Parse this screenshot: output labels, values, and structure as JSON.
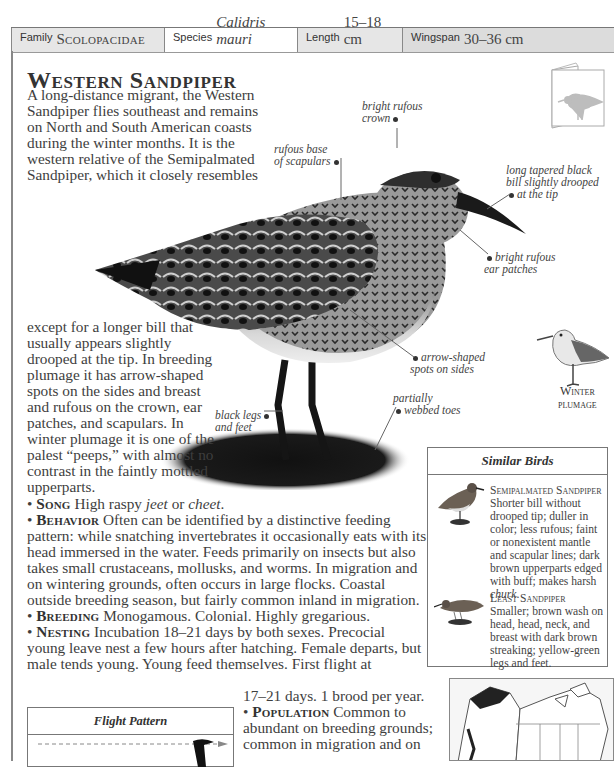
{
  "header": {
    "family_label": "Family",
    "family_value": "Scolopacidae",
    "species_label": "Species",
    "species_value": "Calidris mauri",
    "length_label": "Length",
    "length_value": "15–18 cm",
    "wingspan_label": "Wingspan",
    "wingspan_value": "30–36 cm"
  },
  "title": "Western Sandpiper",
  "intro": {
    "part1": "A long-distance migrant, the Western Sandpiper flies southeast and remains on North and South American coasts during the winter months. It is the western relative of the Semipalmated Sandpiper, which it closely resembles",
    "part2": "except for a longer bill that usually appears slightly drooped at the tip. In breeding plumage it has arrow-shaped spots on the sides and breast and rufous on the crown, ear patches, and scapulars. In winter plumage it is one of the palest “peeps,” with almost no contrast in the faintly mottled upperparts."
  },
  "annotations": {
    "crown": [
      "bright rufous",
      "crown"
    ],
    "scapulars": [
      "rufous base",
      "of scapulars"
    ],
    "bill": [
      "long tapered black",
      "bill slightly drooped",
      "at the tip"
    ],
    "ear": [
      "bright rufous",
      "ear patches"
    ],
    "spots": [
      "arrow-shaped",
      "spots on sides"
    ],
    "toes": [
      "partially",
      "webbed toes"
    ],
    "legs": [
      "black legs",
      "and feet"
    ]
  },
  "winter_label": [
    "Winter",
    "plumage"
  ],
  "facts": {
    "song": {
      "key": "Song",
      "text_a": " High raspy ",
      "em1": "jeet",
      "text_b": " or ",
      "em2": "cheet",
      "text_c": "."
    },
    "behavior": {
      "key": "Behavior",
      "text": " Often can be identified by a distinctive feeding pattern: while snatching invertebrates it occasionally eats with its head immersed in the water. Feeds primarily on insects but also takes small crustaceans, mollusks, and worms. In migration and on wintering grounds, often occurs in large flocks. Coastal outside breeding season, but fairly common inland in migration."
    },
    "breeding": {
      "key": "Breeding",
      "text": " Monogamous. Colonial. Highly gregarious."
    },
    "nesting": {
      "key": "Nesting",
      "text": " Incubation 18–21 days by both sexes. Precocial young leave nest a few hours after hatching. Female departs, but male tends young. Young feed themselves. First flight at"
    },
    "nesting_tail": "17–21 days. 1 brood per year.",
    "population": {
      "key": "Population",
      "text": " Common to abundant on breeding grounds; common in migration and on"
    }
  },
  "similar_birds": {
    "title": "Similar Birds",
    "items": [
      {
        "name": "Semipalmated Sandpiper",
        "desc_a": "Shorter bill without drooped tip; duller in color; less rufous; faint or nonexistent mantle and scapular lines; dark brown upperparts edged with buff; makes harsh ",
        "desc_em": "churk",
        "desc_b": "."
      },
      {
        "name": "Least Sandpiper",
        "desc_a": "Smaller; brown wash on head, head, neck, and breast with dark brown streaking; yellow-green legs and feet.",
        "desc_em": "",
        "desc_b": ""
      }
    ]
  },
  "flight_pattern": {
    "title": "Flight Pattern"
  }
}
